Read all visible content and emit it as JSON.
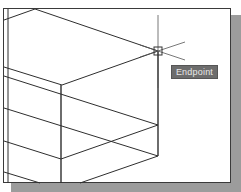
{
  "canvas": {
    "background": "#ffffff",
    "line_color": "#2e2e2e",
    "frame_color": "#3a3a3a",
    "shadow_color": "#9c9c9c"
  },
  "cursor": {
    "type": "crosshair",
    "snap_marker": "endpoint-square"
  },
  "osnap_tooltip": {
    "label": "Endpoint",
    "background": "#6d6d6d",
    "text_color": "#e8e8e8"
  }
}
